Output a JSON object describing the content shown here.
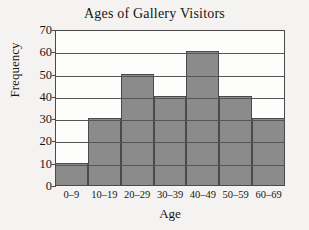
{
  "chart_data": {
    "type": "bar",
    "title": "Ages of Gallery Visitors",
    "xlabel": "Age",
    "ylabel": "Frequency",
    "categories": [
      "0–9",
      "10–19",
      "20–29",
      "30–39",
      "40–49",
      "50–59",
      "60–69"
    ],
    "values": [
      10,
      30,
      50,
      40,
      60,
      40,
      30
    ],
    "ylim": [
      0,
      70
    ],
    "yticks": [
      0,
      10,
      20,
      30,
      40,
      50,
      60,
      70
    ],
    "ytick_labels": [
      "0",
      "10",
      "20",
      "30",
      "40",
      "50",
      "60",
      "70"
    ],
    "grid": "horizontal",
    "legend": "none",
    "bar_color": "#8b8b8b",
    "bar_edge_color": "#4a4a4a",
    "plot_background": "#fdfdfc",
    "figure_background": "#f4f3f1",
    "text_color": "#161616"
  }
}
